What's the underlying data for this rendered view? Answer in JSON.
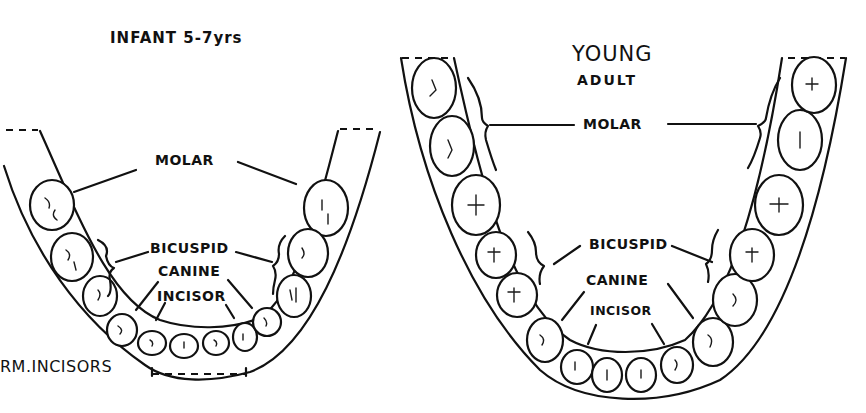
{
  "diagram": {
    "type": "dental-arch-comparison",
    "ink_color": "#111111",
    "background_color": "#ffffff",
    "infant": {
      "title": "INFANT 5-7yrs",
      "labels": {
        "molar": "MOLAR",
        "bicuspid": "BICUSPID",
        "canine": "CANINE",
        "incisor": "INCISOR",
        "permanent_incisors": "RM.INCISORS"
      }
    },
    "young_adult": {
      "title_line1": "YOUNG",
      "title_line2": "ADULT",
      "labels": {
        "molar": "MOLAR",
        "bicuspid": "BICUSPID",
        "canine": "CANINE",
        "incisor": "INCISOR"
      }
    }
  }
}
